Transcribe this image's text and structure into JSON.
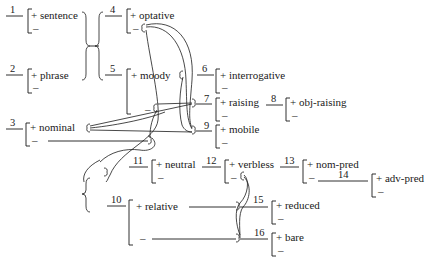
{
  "diagram": {
    "type": "system network",
    "features": [
      {
        "id": "1",
        "plus": "+ sentence",
        "minus": "–"
      },
      {
        "id": "2",
        "plus": "+ phrase",
        "minus": "–"
      },
      {
        "id": "3",
        "plus": "+ nominal",
        "minus": "–"
      },
      {
        "id": "4",
        "plus": "+ optative",
        "minus": "–"
      },
      {
        "id": "5",
        "plus": "+ moody",
        "minus": "–"
      },
      {
        "id": "6",
        "plus": "+ interrogative",
        "minus": "–"
      },
      {
        "id": "7",
        "plus": "+ raising",
        "minus": "–"
      },
      {
        "id": "8",
        "plus": "+ obj-raising",
        "minus": "–"
      },
      {
        "id": "9",
        "plus": "+ mobile",
        "minus": "–"
      },
      {
        "id": "10",
        "plus": "+ relative",
        "minus": "–"
      },
      {
        "id": "11",
        "plus": "+ neutral",
        "minus": "–"
      },
      {
        "id": "12",
        "plus": "+ verbless",
        "minus": "–"
      },
      {
        "id": "13",
        "plus": "+ nom-pred",
        "minus": "–"
      },
      {
        "id": "14",
        "plus": "+ adv-pred",
        "minus": "–"
      },
      {
        "id": "15",
        "plus": "+ reduced",
        "minus": "–"
      },
      {
        "id": "16",
        "plus": "+ bare",
        "minus": "–"
      }
    ]
  }
}
